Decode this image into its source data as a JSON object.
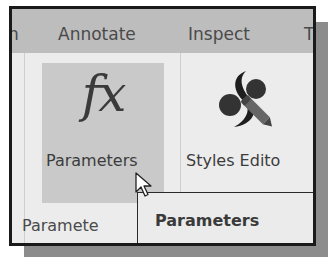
{
  "tabs": [
    {
      "label": "n",
      "active": false
    },
    {
      "label": "Annotate",
      "active": false
    },
    {
      "label": "Inspect",
      "active": false
    },
    {
      "label": "T",
      "active": false
    }
  ],
  "ribbon": {
    "buttons": [
      {
        "label": "Parameters",
        "icon": "fx-icon",
        "hovered": true
      },
      {
        "label": "Styles Edito",
        "icon": "styles-editor-icon",
        "hovered": false
      }
    ],
    "group_label": "Paramete"
  },
  "tooltip": {
    "title": "Parameters"
  },
  "colors": {
    "tabstrip": "#bdbdbd",
    "ribbon": "#ececec",
    "hover": "#c9c9c9",
    "frame": "#1a1a1a"
  }
}
